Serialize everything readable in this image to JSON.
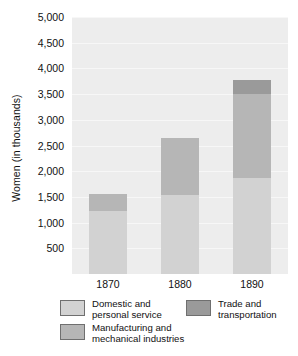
{
  "chart_data": {
    "type": "bar",
    "subtype": "stacked-bar",
    "title": "",
    "xlabel": "",
    "ylabel": "Women (in thousands)",
    "categories": [
      "1870",
      "1880",
      "1890"
    ],
    "ylim": [
      0,
      5000
    ],
    "yticks": [
      500,
      1000,
      1500,
      2000,
      2500,
      3000,
      3500,
      4000,
      4500,
      5000
    ],
    "ytick_labels": [
      "500",
      "1,000",
      "1,500",
      "2,000",
      "2,500",
      "3,000",
      "3,500",
      "4,000",
      "4,500",
      "5,000"
    ],
    "grid": true,
    "legend_position": "bottom",
    "series": [
      {
        "name": "Domestic and\npersonal service",
        "color": "#d2d2d2",
        "values": [
          1230,
          1530,
          1870
        ]
      },
      {
        "name": "Manufacturing and\nmechanical industries",
        "color": "#b6b6b6",
        "values": [
          320,
          1110,
          1640
        ]
      },
      {
        "name": "Trade and\ntransportation",
        "color": "#9a9a9a",
        "values": [
          0,
          0,
          260
        ]
      }
    ],
    "totals": [
      1550,
      2640,
      3770
    ],
    "plot_background": "#ededed",
    "gridline_color": "#f7f7f7"
  }
}
